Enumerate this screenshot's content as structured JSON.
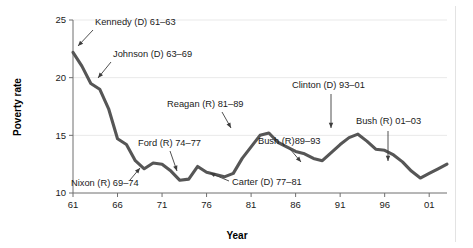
{
  "chart_data": {
    "type": "line",
    "title": "",
    "xlabel": "Year",
    "ylabel": "Poverty rate",
    "xlim": [
      61,
      103
    ],
    "ylim": [
      10,
      25
    ],
    "grid": true,
    "legend": "none",
    "x_tick_labels": [
      "61",
      "66",
      "71",
      "76",
      "81",
      "86",
      "91",
      "96",
      "01"
    ],
    "x_tick_values": [
      61,
      66,
      71,
      76,
      81,
      86,
      91,
      96,
      101
    ],
    "y_tick_labels": [
      "10",
      "15",
      "20",
      "25"
    ],
    "y_tick_values": [
      10,
      15,
      20,
      25
    ],
    "series": [
      {
        "name": "Poverty rate",
        "color": "#565656",
        "x": [
          61,
          62,
          63,
          64,
          65,
          66,
          67,
          68,
          69,
          70,
          71,
          72,
          73,
          74,
          75,
          76,
          77,
          78,
          79,
          80,
          81,
          82,
          83,
          84,
          85,
          86,
          87,
          88,
          89,
          90,
          91,
          92,
          93,
          94,
          95,
          96,
          97,
          98,
          99,
          100,
          101,
          102,
          103
        ],
        "values": [
          22.2,
          21.0,
          19.5,
          19.0,
          17.3,
          14.7,
          14.2,
          12.8,
          12.1,
          12.6,
          12.5,
          11.9,
          11.1,
          11.2,
          12.3,
          11.8,
          11.6,
          11.4,
          11.7,
          13.0,
          14.0,
          15.0,
          15.2,
          14.4,
          14.0,
          13.6,
          13.4,
          13.0,
          12.8,
          13.5,
          14.2,
          14.8,
          15.1,
          14.5,
          13.8,
          13.7,
          13.3,
          12.7,
          11.9,
          11.3,
          11.7,
          12.1,
          12.5
        ]
      }
    ],
    "annotations": [
      {
        "id": "kennedy",
        "text": "Kennedy (D) 61–63",
        "text_x": 95,
        "text_y": 25,
        "arrow_from_x": 93,
        "arrow_from_y": 30,
        "arrow_to_x": 78,
        "arrow_to_y": 46
      },
      {
        "id": "johnson",
        "text": "Johnson (D) 63–69",
        "text_x": 113,
        "text_y": 57,
        "arrow_from_x": 111,
        "arrow_from_y": 62,
        "arrow_to_x": 98,
        "arrow_to_y": 78
      },
      {
        "id": "nixon",
        "text": "Nixon (R) 69–74",
        "text_x": 71,
        "text_y": 186,
        "arrow_from_x": 130,
        "arrow_from_y": 180,
        "arrow_to_x": 140,
        "arrow_to_y": 168
      },
      {
        "id": "ford",
        "text": "Ford (R) 74–77",
        "text_x": 138,
        "text_y": 146,
        "arrow_from_x": 170,
        "arrow_from_y": 151,
        "arrow_to_x": 177,
        "arrow_to_y": 171
      },
      {
        "id": "carter",
        "text": "Carter (D) 77–81",
        "text_x": 232,
        "text_y": 185,
        "arrow_from_x": 229,
        "arrow_from_y": 181,
        "arrow_to_x": 210,
        "arrow_to_y": 173
      },
      {
        "id": "reagan",
        "text": "Reagan (R) 81–89",
        "text_x": 167,
        "text_y": 107,
        "arrow_from_x": 222,
        "arrow_from_y": 112,
        "arrow_to_x": 231,
        "arrow_to_y": 128
      },
      {
        "id": "bush41",
        "text": "Bush (R)89–93",
        "text_x": 258,
        "text_y": 144,
        "arrow_from_x": 290,
        "arrow_from_y": 149,
        "arrow_to_x": 301,
        "arrow_to_y": 162
      },
      {
        "id": "clinton",
        "text": "Clinton (D) 93–01",
        "text_x": 292,
        "text_y": 88,
        "arrow_from_x": 331,
        "arrow_from_y": 94,
        "arrow_to_x": 331,
        "arrow_to_y": 128
      },
      {
        "id": "bush43",
        "text": "Bush (R) 01–03",
        "text_x": 356,
        "text_y": 124,
        "arrow_from_x": 388,
        "arrow_from_y": 131,
        "arrow_to_x": 388,
        "arrow_to_y": 161
      }
    ]
  }
}
